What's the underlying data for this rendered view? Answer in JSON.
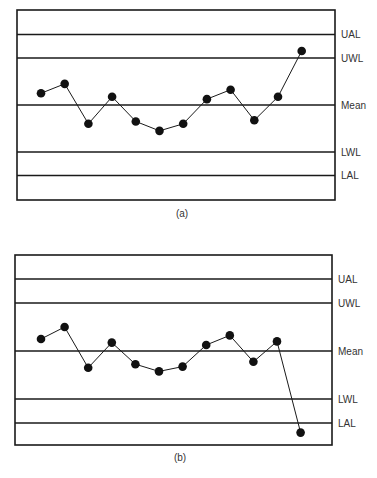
{
  "chart_data": [
    {
      "type": "line",
      "title": "",
      "caption": "(a)",
      "xlabel": "",
      "ylabel": "",
      "grid": false,
      "units": "standard deviations from mean",
      "ylim": [
        -4,
        4.5
      ],
      "control_lines": [
        {
          "label": "UAL",
          "value": 3
        },
        {
          "label": "UWL",
          "value": 2
        },
        {
          "label": "Mean",
          "value": 0
        },
        {
          "label": "LWL",
          "value": -2
        },
        {
          "label": "LAL",
          "value": -3
        }
      ],
      "x": [
        1,
        2,
        3,
        4,
        5,
        6,
        7,
        8,
        9,
        10,
        11,
        12
      ],
      "series": [
        {
          "name": "Observations",
          "values": [
            0.5,
            0.9,
            -0.8,
            0.35,
            -0.7,
            -1.1,
            -0.8,
            0.25,
            0.65,
            -0.65,
            0.35,
            2.3
          ]
        }
      ]
    },
    {
      "type": "line",
      "title": "",
      "caption": "(b)",
      "xlabel": "",
      "ylabel": "",
      "grid": false,
      "units": "standard deviations from mean",
      "ylim": [
        -4,
        4.5
      ],
      "control_lines": [
        {
          "label": "UAL",
          "value": 3
        },
        {
          "label": "UWL",
          "value": 2
        },
        {
          "label": "Mean",
          "value": 0
        },
        {
          "label": "LWL",
          "value": -2
        },
        {
          "label": "LAL",
          "value": -3
        }
      ],
      "x": [
        1,
        2,
        3,
        4,
        5,
        6,
        7,
        8,
        9,
        10,
        11,
        12
      ],
      "series": [
        {
          "name": "Observations",
          "values": [
            0.5,
            1.0,
            -0.7,
            0.35,
            -0.55,
            -0.85,
            -0.65,
            0.25,
            0.65,
            -0.45,
            0.4,
            -3.4
          ]
        }
      ]
    }
  ],
  "style": {
    "line_color": "#1a1a1a",
    "marker_color": "#111111",
    "label_color": "#333333"
  }
}
